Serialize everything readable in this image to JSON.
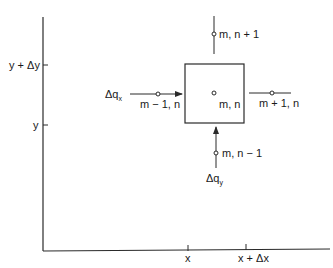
{
  "diagram": {
    "type": "finite-difference-grid-cell",
    "axes": {
      "y_ticks": [
        {
          "label": "y + Δy",
          "value": "y+dy"
        },
        {
          "label": "y",
          "value": "y"
        }
      ],
      "x_ticks": [
        {
          "label": "x",
          "value": "x"
        },
        {
          "label": "x + Δx",
          "value": "x+dx"
        }
      ]
    },
    "nodes": {
      "center": "m, n",
      "top": "m, n + 1",
      "bottom": "m, n − 1",
      "left": "m − 1, n",
      "right": "m + 1, n"
    },
    "flows": {
      "qx": {
        "main": "Δq",
        "sub": "x"
      },
      "qy": {
        "main": "Δq",
        "sub": "y"
      }
    },
    "colors": {
      "line": "#2a2a2a",
      "background": "#ffffff"
    }
  }
}
